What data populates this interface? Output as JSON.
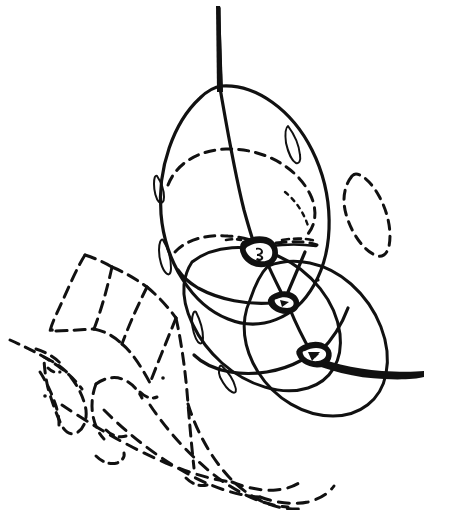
{
  "figure": {
    "title": "",
    "caption": "",
    "background_color": "#ffffff",
    "ink_color": "#111111",
    "style": "scientific line drawing, pen and ink",
    "width": 450,
    "height": 510
  },
  "parts": {
    "stem": {
      "name": "axial-stem",
      "label": "",
      "line_style": "solid",
      "stroke_width": 3.4
    },
    "upper_body": {
      "name": "upper-ellipse",
      "label": "",
      "line_style": "solid",
      "stroke_width": 3.0
    },
    "lower_body": {
      "name": "lower-ellipse",
      "label": "",
      "line_style": "solid",
      "stroke_width": 3.0
    },
    "right_body": {
      "name": "right-ellipse",
      "label": "",
      "line_style": "solid",
      "stroke_width": 3.0
    },
    "hidden_girdle": {
      "name": "hidden-girdle",
      "label": "",
      "line_style": "dashed",
      "stroke_width": 3.0
    },
    "detached_oval": {
      "name": "detached-dashed-oval",
      "label": "",
      "line_style": "dashed",
      "stroke_width": 3.0
    },
    "hidden_segments": {
      "name": "hidden-segment-group",
      "label": "",
      "line_style": "dashed",
      "stroke_width": 3.0,
      "count": 9
    },
    "rim_lenses": {
      "name": "rim-lens-group",
      "label": "",
      "line_style": "solid",
      "stroke_width": 2.0,
      "count": 5
    },
    "nodes": {
      "name": "junction-node-group",
      "label": "",
      "line_style": "solid-filled",
      "count": 3
    },
    "tail": {
      "name": "tapering-tail",
      "label": "",
      "line_style": "solid",
      "stroke_width": 5.0
    }
  },
  "annotations": {
    "visible_text": []
  }
}
